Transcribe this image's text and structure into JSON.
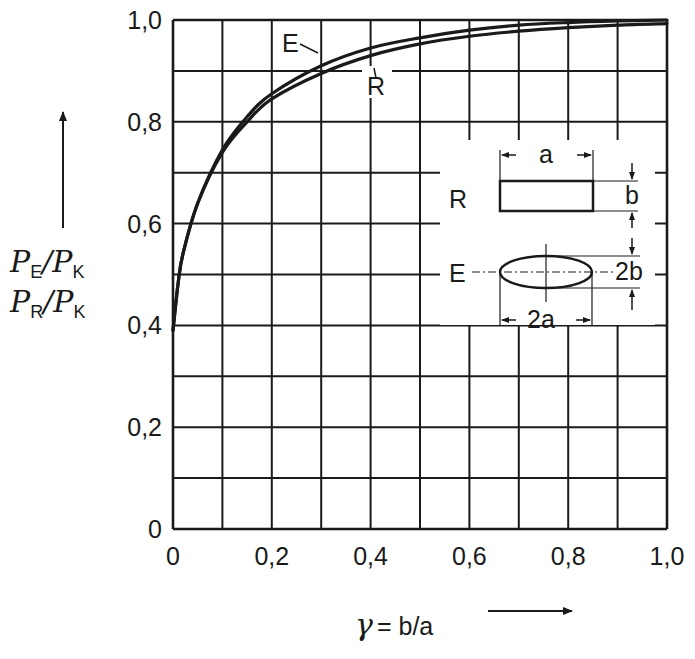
{
  "chart_data": {
    "type": "line",
    "title": "",
    "xlabel": "γ = b/a",
    "ylabel": "P_E/P_K , P_R/P_K",
    "xlim": [
      0,
      1.0
    ],
    "ylim": [
      0,
      1.0
    ],
    "grid": true,
    "grid_step_x": 0.1,
    "grid_step_y": 0.1,
    "x_tick_labels": [
      "0",
      "0,2",
      "0,4",
      "0,6",
      "0,8",
      "1,0"
    ],
    "y_tick_labels": [
      "0",
      "0,2",
      "0,4",
      "0,6",
      "0,8",
      "1,0"
    ],
    "series": [
      {
        "name": "E",
        "description": "ellipse",
        "x": [
          0.0,
          0.01,
          0.02,
          0.05,
          0.1,
          0.15,
          0.2,
          0.3,
          0.4,
          0.5,
          0.6,
          0.7,
          0.8,
          0.9,
          1.0
        ],
        "y": [
          0.39,
          0.48,
          0.54,
          0.64,
          0.745,
          0.81,
          0.855,
          0.91,
          0.945,
          0.965,
          0.98,
          0.99,
          0.995,
          0.998,
          1.0
        ]
      },
      {
        "name": "R",
        "description": "rectangle",
        "x": [
          0.0,
          0.01,
          0.02,
          0.05,
          0.1,
          0.15,
          0.2,
          0.3,
          0.4,
          0.5,
          0.6,
          0.7,
          0.8,
          0.9,
          1.0
        ],
        "y": [
          0.39,
          0.48,
          0.54,
          0.64,
          0.74,
          0.8,
          0.845,
          0.895,
          0.93,
          0.953,
          0.968,
          0.978,
          0.985,
          0.99,
          0.993
        ]
      }
    ],
    "annotations": [
      "E",
      "R",
      "a",
      "b",
      "2a",
      "2b"
    ]
  },
  "labels": {
    "curve_e": "E",
    "curve_r": "R",
    "y_axis_line1_main1": "P",
    "y_axis_line1_sub1": "E",
    "y_axis_line1_main2": "/P",
    "y_axis_line1_sub2": "K",
    "y_axis_line2_main1": "P",
    "y_axis_line2_sub1": "R",
    "y_axis_line2_main2": "/P",
    "y_axis_line2_sub2": "K",
    "x_axis_gamma": "γ",
    "x_axis_rest": "= b/a"
  },
  "inset": {
    "rect_label": "R",
    "ellipse_label": "E",
    "dim_a": "a",
    "dim_b": "b",
    "dim_2a": "2a",
    "dim_2b": "2b"
  }
}
